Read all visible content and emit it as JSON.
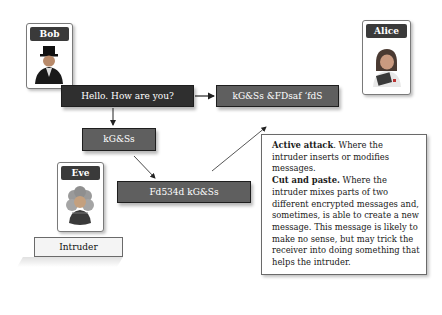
{
  "actors": {
    "bob": {
      "name": "Bob",
      "figure": "man-top-hat-icon"
    },
    "alice": {
      "name": "Alice",
      "figure": "woman-reading-icon"
    },
    "eve": {
      "name": "Eve",
      "figure": "flower-head-figure-icon"
    }
  },
  "messages": {
    "original": "Hello. How are you?",
    "encrypted": "kG&Ss &FDsaf ‘fdS",
    "intercepted": "kG&Ss",
    "modified": "Fd534d kG&Ss"
  },
  "intruder_label": "Intruder",
  "description": {
    "active_title": "Active attack",
    "active_text": ". Where the intruder inserts or modifies messages.",
    "cut_title": "Cut and paste.",
    "cut_text": " Where the intruder mixes parts of two different encrypted messages and, sometimes, is able to create a new message. This message is likely to make no sense, but may trick the receiver into doing something that helps the intruder."
  },
  "colors": {
    "dark_box": "#2f2f2f",
    "mid_box": "#5f5f5f",
    "arrow": "#333333"
  }
}
